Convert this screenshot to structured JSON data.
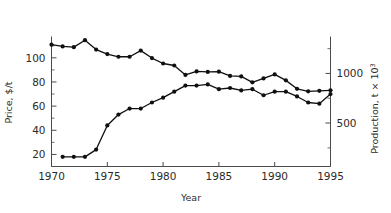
{
  "chart_data": {
    "type": "line",
    "title": "",
    "xlabel": "Year",
    "ylabel": "Price, $/t",
    "y2label": "Production, t × 10³",
    "y2label_base": "Production, t × 10",
    "y2label_exp": "3",
    "xlim": [
      1970,
      1995
    ],
    "ylim": [
      10,
      116
    ],
    "y2lim": [
      62,
      1352
    ],
    "xticks": [
      1970,
      1975,
      1980,
      1985,
      1990,
      1995
    ],
    "xtick_labels": [
      "1970",
      "1975",
      "1980",
      "1985",
      "1990",
      "1995"
    ],
    "yticks": [
      20,
      40,
      60,
      80,
      100
    ],
    "ytick_labels": [
      "20",
      "40",
      "60",
      "80",
      "100"
    ],
    "yticks_minor": [
      30,
      50,
      70,
      90,
      110
    ],
    "y2ticks": [
      500,
      1000
    ],
    "y2tick_labels": [
      "500",
      "1000"
    ],
    "y2ticks_minor": [
      250,
      750,
      1250
    ],
    "grid": false,
    "legend": "none",
    "markers": "filled-circle",
    "series": [
      {
        "name": "Price, $/t",
        "axis": "left",
        "x": [
          1971,
          1972,
          1973,
          1974,
          1975,
          1976,
          1977,
          1978,
          1979,
          1980,
          1981,
          1982,
          1983,
          1984,
          1985,
          1986,
          1987,
          1988,
          1989,
          1990,
          1991,
          1992,
          1993,
          1994,
          1995
        ],
        "values": [
          18,
          18,
          18,
          24,
          44,
          53,
          58,
          58,
          63,
          67,
          72,
          77,
          77,
          78,
          74,
          75,
          73,
          74,
          69,
          72,
          72,
          68,
          63,
          62,
          70
        ]
      },
      {
        "name": "Production, t × 10³",
        "axis": "right",
        "x": [
          1970,
          1971,
          1972,
          1973,
          1974,
          1975,
          1976,
          1977,
          1978,
          1979,
          1980,
          1981,
          1982,
          1983,
          1984,
          1985,
          1986,
          1987,
          1988,
          1989,
          1990,
          1991,
          1992,
          1993,
          1994,
          1995
        ],
        "values": [
          1290,
          1272,
          1265,
          1335,
          1240,
          1195,
          1168,
          1168,
          1230,
          1155,
          1100,
          1080,
          985,
          1020,
          1015,
          1018,
          975,
          970,
          910,
          950,
          990,
          930,
          845,
          820,
          825,
          830
        ]
      }
    ]
  }
}
